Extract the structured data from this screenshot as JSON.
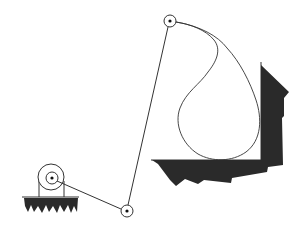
{
  "diagram": {
    "type": "four-bar-linkage-coupler-curve",
    "colors": {
      "line": "#333333",
      "fill": "#2a2a2a",
      "background": "#ffffff"
    },
    "joints": [
      {
        "name": "crank-pivot",
        "x": 52,
        "y": 178
      },
      {
        "name": "lower-joint",
        "x": 127,
        "y": 211
      },
      {
        "name": "upper-joint",
        "x": 170,
        "y": 21
      }
    ],
    "labels": []
  }
}
